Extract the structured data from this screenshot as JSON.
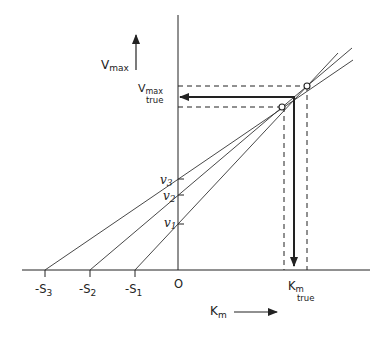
{
  "diagram": {
    "type": "direct linear plot (Eisenthal–Cornish-Bowden)",
    "y_axis_label": "V",
    "y_axis_label_sub": "max",
    "x_axis_label": "K",
    "x_axis_label_sub": "m",
    "origin_label": "O",
    "vmax_true_label": "V",
    "vmax_true_sub": "max",
    "vmax_true_word": "true",
    "km_true_label": "K",
    "km_true_sub": "m",
    "km_true_word": "true",
    "x_ticks": [
      {
        "label": "-S",
        "sub": "3"
      },
      {
        "label": "-S",
        "sub": "2"
      },
      {
        "label": "-S",
        "sub": "1"
      }
    ],
    "y_ticks": [
      {
        "label": "v",
        "sub": "3"
      },
      {
        "label": "v",
        "sub": "2"
      },
      {
        "label": "v",
        "sub": "1"
      }
    ],
    "lines": [
      {
        "name": "line-1",
        "from": "-S1",
        "through": "v1"
      },
      {
        "name": "line-2",
        "from": "-S2",
        "through": "v2"
      },
      {
        "name": "line-3",
        "from": "-S3",
        "through": "v3"
      }
    ],
    "intersection_markers": 2,
    "colors": {
      "ink": "#222222",
      "background": "#ffffff"
    }
  }
}
